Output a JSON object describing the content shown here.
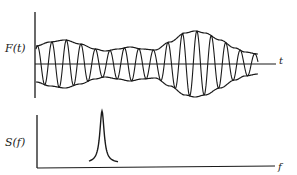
{
  "figure": {
    "width": 297,
    "height": 175,
    "ink_color": "#1a1a1a",
    "background": "#ffffff"
  },
  "top_plot": {
    "ylabel": "F(t)",
    "xlabel": "t",
    "axis": {
      "x0": 35,
      "y_top": 12,
      "y_bottom": 98,
      "baseline_y": 64,
      "x_end": 276
    },
    "signal": {
      "description": "amplitude-modulated oscillation with envelope",
      "x_start": 36,
      "x_end": 258,
      "period_px": 14.5,
      "envelope_points": [
        [
          36,
          18
        ],
        [
          50,
          22
        ],
        [
          65,
          24
        ],
        [
          80,
          20
        ],
        [
          95,
          15
        ],
        [
          105,
          13
        ],
        [
          118,
          15
        ],
        [
          130,
          17
        ],
        [
          142,
          15
        ],
        [
          155,
          14
        ],
        [
          170,
          22
        ],
        [
          185,
          31
        ],
        [
          195,
          33
        ],
        [
          205,
          31
        ],
        [
          220,
          24
        ],
        [
          235,
          16
        ],
        [
          245,
          12
        ],
        [
          258,
          10
        ]
      ]
    }
  },
  "bottom_plot": {
    "ylabel": "S(f)",
    "xlabel": "f",
    "axis": {
      "x0": 37,
      "y_top": 115,
      "y_bottom": 168,
      "x_end": 275
    },
    "peak": {
      "center_x": 102,
      "top_y": 111,
      "base_y": 163,
      "left_x": 89,
      "right_x": 118
    }
  }
}
